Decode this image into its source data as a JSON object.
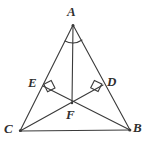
{
  "figure": {
    "kind": "geometry-diagram",
    "background_color": "#ffffff",
    "stroke_color": "#3a3a3a",
    "label_color": "#2f2f2f",
    "stroke_width": 1.1,
    "width": 148,
    "height": 146
  },
  "points": {
    "A": {
      "label": "A",
      "x": 73,
      "y": 25
    },
    "B": {
      "label": "B",
      "x": 130,
      "y": 130
    },
    "C": {
      "label": "C",
      "x": 20,
      "y": 131
    },
    "D": {
      "label": "D",
      "x": 103,
      "y": 85
    },
    "E": {
      "label": "E",
      "x": 43,
      "y": 86
    },
    "F": {
      "label": "F",
      "x": 72,
      "y": 103
    }
  },
  "segments": [
    {
      "name": "side-AC",
      "from": "A",
      "to": "C"
    },
    {
      "name": "side-AB",
      "from": "A",
      "to": "B"
    },
    {
      "name": "side-CB",
      "from": "C",
      "to": "B"
    },
    {
      "name": "cevian-AF",
      "from": "A",
      "to": "F"
    },
    {
      "name": "cevian-CD",
      "from": "C",
      "to": "D"
    },
    {
      "name": "cevian-BE",
      "from": "B",
      "to": "E"
    }
  ],
  "marks": {
    "right_angles": [
      {
        "name": "right-angle-at-E",
        "at": "E",
        "on": "side-AC"
      },
      {
        "name": "right-angle-at-D",
        "at": "D",
        "on": "side-AB"
      }
    ],
    "angle_arcs": [
      {
        "name": "angle-arc-A-left",
        "at": "A"
      },
      {
        "name": "angle-arc-A-right",
        "at": "A"
      }
    ]
  }
}
